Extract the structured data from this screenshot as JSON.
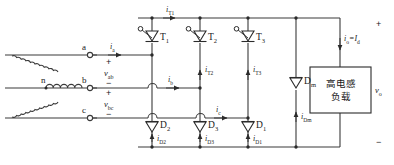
{
  "figure": {
    "type": "circuit-schematic"
  },
  "source": {
    "neutral_label": "n",
    "terminals": [
      {
        "name": "a",
        "label": "a"
      },
      {
        "name": "b",
        "label": "b"
      },
      {
        "name": "c",
        "label": "c"
      }
    ]
  },
  "voltages": {
    "v_ab": "v",
    "v_ab_sub": "ab",
    "v_bc": "v",
    "v_bc_sub": "bc",
    "v_o": "v",
    "v_o_sub": "o"
  },
  "signs": {
    "plus_ab": "+",
    "minus_ab": "−",
    "plus_bc": "+",
    "minus_bc": "−",
    "plus_out": "+",
    "minus_out": "−"
  },
  "line_currents": [
    {
      "name": "i-a",
      "sym": "i",
      "sub": "a"
    },
    {
      "name": "i-b",
      "sym": "i",
      "sub": "b"
    },
    {
      "name": "i-c",
      "sym": "i",
      "sub": "c"
    }
  ],
  "thyristors": [
    {
      "name": "T1",
      "sym": "T",
      "sub": "1",
      "current_sym": "i",
      "current_sub": "T1"
    },
    {
      "name": "T2",
      "sym": "T",
      "sub": "2",
      "current_sym": "i",
      "current_sub": "T2"
    },
    {
      "name": "T3",
      "sym": "T",
      "sub": "3",
      "current_sym": "i",
      "current_sub": "T3"
    }
  ],
  "diodes": [
    {
      "name": "D2",
      "sym": "D",
      "sub": "2",
      "current_sym": "i",
      "current_sub": "D2"
    },
    {
      "name": "D3",
      "sym": "D",
      "sub": "3",
      "current_sym": "i",
      "current_sub": "D3"
    },
    {
      "name": "D1",
      "sym": "D",
      "sub": "1",
      "current_sym": "i",
      "current_sub": "D1"
    }
  ],
  "freewheel_diode": {
    "name": "Dm",
    "sym": "D",
    "sub": "m",
    "current_sym": "i",
    "current_sub": "Dm"
  },
  "output": {
    "current_label": "i",
    "current_sub": "o",
    "current_eq": "=",
    "current_label2": "I",
    "current_sub2": "d"
  },
  "load": {
    "line1": "高电感",
    "line2": "负载"
  },
  "colors": {
    "wire": "#3a3a3a",
    "device": "#2b2b2b",
    "background": "#ffffff",
    "text": "#1a1a1a"
  }
}
